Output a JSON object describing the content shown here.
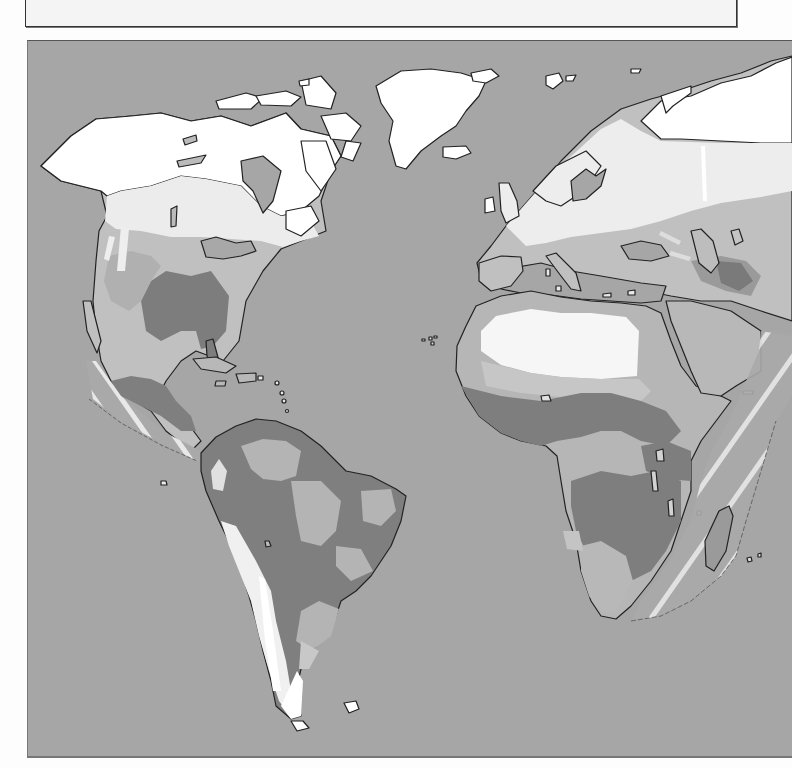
{
  "caption": {
    "text": ""
  },
  "map": {
    "type": "world vegetation / climate zone map (grayscale)",
    "regions_shown": [
      "North America",
      "Central America",
      "Caribbean",
      "South America",
      "Greenland",
      "Europe",
      "Africa",
      "Middle East",
      "Madagascar"
    ],
    "colors": {
      "ocean": "#a6a6a6",
      "ice_tundra": "#ffffff",
      "boreal": "#ededed",
      "desert": "#f6f6f6",
      "temperate_light": "#c4c4c4",
      "grassland": "#b4b4b4",
      "forest_dark": "#7c7c7c",
      "mediterranean": "#999999",
      "coastline": "#222222",
      "hatched_stripes": "#e6e6e6"
    },
    "legend": []
  }
}
